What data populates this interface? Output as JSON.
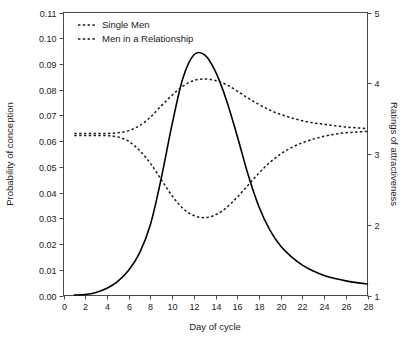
{
  "chart_data": {
    "type": "line",
    "title": "",
    "xlabel": "Day of cycle",
    "ylabel": "Probability of conception",
    "y2label": "Ratings of attractiveness",
    "xlim": [
      0,
      28
    ],
    "ylim": [
      0.0,
      0.11
    ],
    "y2lim": [
      1,
      5
    ],
    "grid": false,
    "legend_position": "top-left-inside",
    "xticks": [
      0,
      2,
      4,
      6,
      8,
      10,
      12,
      14,
      16,
      18,
      20,
      22,
      24,
      26,
      28
    ],
    "xtick_labels": [
      "0",
      "2",
      "4",
      "6",
      "8",
      "10",
      "12",
      "14",
      "16",
      "18",
      "20",
      "22",
      "24",
      "26",
      "28"
    ],
    "yticks": [
      0.0,
      0.01,
      0.02,
      0.03,
      0.04,
      0.05,
      0.06,
      0.07,
      0.08,
      0.09,
      0.1,
      0.11
    ],
    "ytick_labels": [
      "0.00",
      "0.01",
      "0.02",
      "0.03",
      "0.04",
      "0.05",
      "0.06",
      "0.07",
      "0.08",
      "0.09",
      "0.10",
      "0.11"
    ],
    "y2ticks": [
      1,
      2,
      3,
      4,
      5
    ],
    "y2tick_labels": [
      "1",
      "2",
      "3",
      "4",
      "5"
    ],
    "x": [
      1,
      2,
      3,
      4,
      5,
      6,
      7,
      8,
      9,
      10,
      11,
      12,
      13,
      14,
      15,
      16,
      17,
      18,
      19,
      20,
      21,
      22,
      23,
      24,
      25,
      26,
      27,
      28
    ],
    "series": [
      {
        "name": "Probability of conception",
        "style": "solid",
        "axis": "left",
        "legend": false,
        "values": [
          0.0002,
          0.0004,
          0.0012,
          0.0028,
          0.0055,
          0.0098,
          0.0165,
          0.0275,
          0.0455,
          0.0665,
          0.0845,
          0.0935,
          0.0935,
          0.087,
          0.076,
          0.062,
          0.047,
          0.0345,
          0.0255,
          0.0192,
          0.015,
          0.0118,
          0.0095,
          0.0078,
          0.0066,
          0.0057,
          0.005,
          0.0045
        ]
      },
      {
        "name": "Single Men",
        "style": "dashed",
        "axis": "right",
        "legend": true,
        "values": [
          3.29,
          3.29,
          3.29,
          3.29,
          3.3,
          3.33,
          3.4,
          3.52,
          3.68,
          3.83,
          3.96,
          4.04,
          4.06,
          4.04,
          3.98,
          3.89,
          3.79,
          3.7,
          3.62,
          3.56,
          3.51,
          3.47,
          3.44,
          3.42,
          3.4,
          3.38,
          3.37,
          3.36
        ]
      },
      {
        "name": "Men in a Relationship",
        "style": "dashed",
        "axis": "right",
        "legend": true,
        "values": [
          3.26,
          3.26,
          3.26,
          3.26,
          3.24,
          3.18,
          3.05,
          2.87,
          2.64,
          2.41,
          2.23,
          2.13,
          2.1,
          2.14,
          2.24,
          2.39,
          2.56,
          2.73,
          2.88,
          3.0,
          3.09,
          3.16,
          3.21,
          3.25,
          3.28,
          3.3,
          3.31,
          3.32
        ]
      }
    ],
    "legend_entries": [
      {
        "label": "Single Men",
        "style": "dashed"
      },
      {
        "label": "Men in a Relationship",
        "style": "dashed"
      }
    ]
  }
}
